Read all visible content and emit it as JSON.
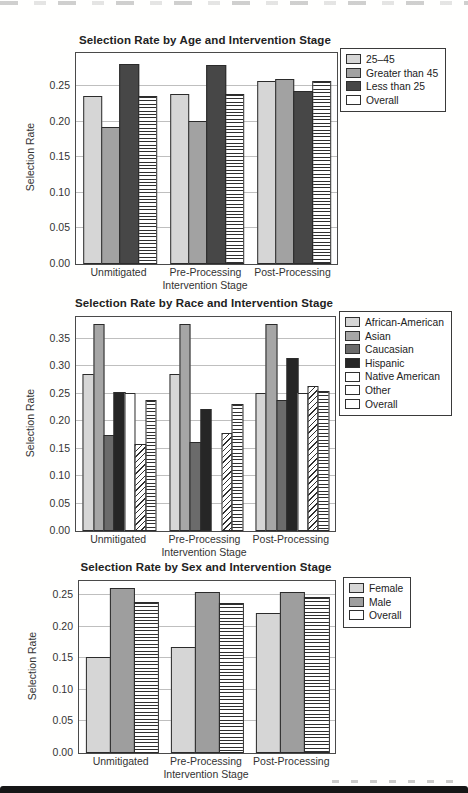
{
  "page": {
    "background": "#ffffff",
    "bottom_rule_color": "#161616"
  },
  "chart_data": [
    {
      "type": "bar",
      "title": "Selection Rate by Age and Intervention Stage",
      "xlabel": "Intervention Stage",
      "ylabel": "Selection Rate",
      "categories": [
        "Unmitigated",
        "Pre-Processing",
        "Post-Processing"
      ],
      "series": [
        {
          "name": "25–45",
          "pattern": "solid",
          "fill": "#d6d6d6",
          "values": [
            0.237,
            0.239,
            0.258
          ]
        },
        {
          "name": "Greater than 45",
          "pattern": "solid",
          "fill": "#a2a2a2",
          "values": [
            0.193,
            0.202,
            0.261
          ]
        },
        {
          "name": "Less than 25",
          "pattern": "solid",
          "fill": "#474747",
          "values": [
            0.281,
            0.28,
            0.243
          ]
        },
        {
          "name": "Overall",
          "pattern": "hlines",
          "fill": "#ffffff",
          "values": [
            0.236,
            0.24,
            0.257
          ]
        }
      ],
      "ylim": [
        0,
        0.297
      ],
      "yticks": [
        0,
        0.05,
        0.1,
        0.15,
        0.2,
        0.25
      ],
      "grid": true,
      "legend_position": "outside upper right"
    },
    {
      "type": "bar",
      "title": "Selection Rate by Race and Intervention Stage",
      "xlabel": "Intervention Stage",
      "ylabel": "Selection Rate",
      "categories": [
        "Unmitigated",
        "Pre-Processing",
        "Post-Processing"
      ],
      "series": [
        {
          "name": "African-American",
          "pattern": "solid",
          "fill": "#d6d6d6",
          "values": [
            0.286,
            0.287,
            0.252
          ]
        },
        {
          "name": "Asian",
          "pattern": "solid",
          "fill": "#a6a6a6",
          "values": [
            0.377,
            0.377,
            0.378
          ]
        },
        {
          "name": "Caucasian",
          "pattern": "solid",
          "fill": "#6b6b6b",
          "values": [
            0.175,
            0.163,
            0.238
          ]
        },
        {
          "name": "Hispanic",
          "pattern": "solid",
          "fill": "#262626",
          "values": [
            0.253,
            0.222,
            0.315
          ]
        },
        {
          "name": "Native American",
          "pattern": "solid",
          "fill": "#ffffff",
          "values": [
            0.251,
            0.0,
            0.252
          ]
        },
        {
          "name": "Other",
          "pattern": "diag",
          "fill": "#ffffff",
          "values": [
            0.158,
            0.178,
            0.265
          ]
        },
        {
          "name": "Overall",
          "pattern": "hlines",
          "fill": "#ffffff",
          "values": [
            0.239,
            0.232,
            0.255
          ]
        }
      ],
      "ylim": [
        0,
        0.39
      ],
      "yticks": [
        0,
        0.05,
        0.1,
        0.15,
        0.2,
        0.25,
        0.3,
        0.35
      ],
      "grid": true,
      "legend_position": "outside upper right"
    },
    {
      "type": "bar",
      "title": "Selection Rate by Sex and Intervention Stage",
      "xlabel": "Intervention Stage",
      "ylabel": "Selection Rate",
      "categories": [
        "Unmitigated",
        "Pre-Processing",
        "Post-Processing"
      ],
      "series": [
        {
          "name": "Female",
          "pattern": "solid",
          "fill": "#d6d6d6",
          "values": [
            0.152,
            0.167,
            0.221
          ]
        },
        {
          "name": "Male",
          "pattern": "solid",
          "fill": "#9e9e9e",
          "values": [
            0.261,
            0.255,
            0.254
          ]
        },
        {
          "name": "Overall",
          "pattern": "hlines",
          "fill": "#ffffff",
          "values": [
            0.239,
            0.237,
            0.247
          ]
        }
      ],
      "ylim": [
        0,
        0.272
      ],
      "yticks": [
        0,
        0.05,
        0.1,
        0.15,
        0.2,
        0.25
      ],
      "grid": true,
      "legend_position": "outside upper right"
    }
  ]
}
